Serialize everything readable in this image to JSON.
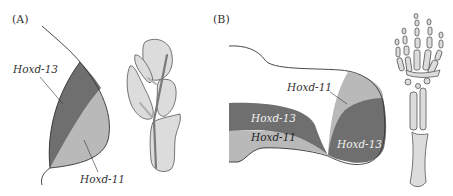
{
  "figure": {
    "panel_a": {
      "label": "(A)",
      "fin_labels": {
        "top": "Hoxd-13",
        "bottom": "Hoxd-11"
      },
      "description": "Fish fin bud with Hoxd-13 (dark) distal/posterior and Hoxd-11 (light) domains, plus fin skeleton"
    },
    "panel_b": {
      "label": "(B)",
      "limb_labels": {
        "upper_right": "Hoxd-11",
        "left_top": "Hoxd-13",
        "left_bottom": "Hoxd-11",
        "right_bottom": "Hoxd-13"
      },
      "description": "Tetrapod limb bud with Hoxd-13 and Hoxd-11 expression domains, plus tetrapod limb skeleton"
    },
    "colors": {
      "hoxd13": "#6f6f6f",
      "hoxd11": "#b9b9b9",
      "bone": "#dcdcdc",
      "outline": "#333333"
    }
  }
}
